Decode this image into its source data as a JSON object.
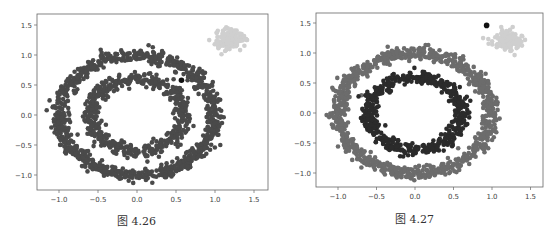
{
  "chart_data": [
    {
      "type": "scatter",
      "title": "",
      "caption": "图 4.26",
      "xlabel": "",
      "ylabel": "",
      "xlim": [
        -1.25,
        1.65
      ],
      "ylim": [
        -1.25,
        1.7
      ],
      "xticks": [
        "-1.0",
        "-0.5",
        "0.0",
        "0.5",
        "1.0",
        "1.5"
      ],
      "yticks": [
        "-1.0",
        "-0.5",
        "0.0",
        "0.5",
        "1.0",
        "1.5"
      ],
      "grid": false,
      "series": [
        {
          "name": "outer ring",
          "shape": "ring",
          "center": [
            0,
            0
          ],
          "radius": 1.0,
          "width": 0.1,
          "color": "#4a4a4a"
        },
        {
          "name": "inner ring",
          "shape": "ring",
          "center": [
            0,
            0
          ],
          "radius": 0.6,
          "width": 0.1,
          "color": "#4a4a4a"
        },
        {
          "name": "blob",
          "shape": "blob",
          "center": [
            1.2,
            1.25
          ],
          "radius": 0.17,
          "color": "#cfcfcf"
        },
        {
          "name": "noise point",
          "shape": "point",
          "center": [
            0.57,
            0.58
          ],
          "color": "#111111"
        }
      ]
    },
    {
      "type": "scatter",
      "title": "",
      "caption": "图 4.27",
      "xlabel": "",
      "ylabel": "",
      "xlim": [
        -1.3,
        1.65
      ],
      "ylim": [
        -1.25,
        1.7
      ],
      "xticks": [
        "-1.0",
        "-0.5",
        "0.0",
        "0.5",
        "1.0",
        "1.5"
      ],
      "yticks": [
        "-1.0",
        "-0.5",
        "0.0",
        "0.5",
        "1.0",
        "1.5"
      ],
      "grid": false,
      "series": [
        {
          "name": "outer ring",
          "shape": "ring",
          "center": [
            0,
            0
          ],
          "radius": 1.0,
          "width": 0.1,
          "color": "#6c6c6c"
        },
        {
          "name": "inner ring",
          "shape": "ring",
          "center": [
            0,
            0
          ],
          "radius": 0.6,
          "width": 0.1,
          "color": "#2b2b2b"
        },
        {
          "name": "blob",
          "shape": "blob",
          "center": [
            1.2,
            1.2
          ],
          "radius": 0.17,
          "color": "#cfcfcf"
        },
        {
          "name": "noise point",
          "shape": "point",
          "center": [
            0.93,
            1.46
          ],
          "color": "#111111"
        }
      ]
    }
  ],
  "panels": [
    {
      "frame": {
        "x": 37,
        "y": 14,
        "w": 231,
        "h": 176
      },
      "origin": [
        137,
        115
      ],
      "scale": [
        78,
        60
      ],
      "caption_pos": [
        117,
        212
      ]
    },
    {
      "frame": {
        "x": 316,
        "y": 13,
        "w": 227,
        "h": 174
      },
      "origin": [
        415,
        113
      ],
      "scale": [
        77,
        60
      ],
      "caption_pos": [
        395,
        210
      ]
    }
  ]
}
